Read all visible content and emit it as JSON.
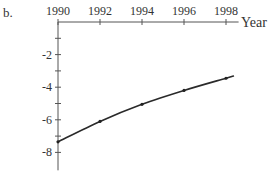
{
  "panel_label": "b.",
  "chart_data": {
    "type": "line",
    "title": "",
    "xlabel": "Year",
    "ylabel": "",
    "x": [
      1990,
      1992,
      1994,
      1996,
      1998
    ],
    "series": [
      {
        "name": "curve",
        "values": [
          -7.35,
          -6.1,
          -5.05,
          -4.2,
          -3.45
        ]
      }
    ],
    "x_ticks": [
      1990,
      1991,
      1992,
      1993,
      1994,
      1995,
      1996,
      1997,
      1998
    ],
    "x_tick_labels": [
      "1990",
      "1992",
      "1994",
      "1996",
      "1998"
    ],
    "y_ticks": [
      -1,
      -2,
      -3,
      -4,
      -5,
      -6,
      -7,
      -8
    ],
    "y_tick_labels": [
      "-2",
      "-4",
      "-6",
      "-8"
    ],
    "xlim": [
      1990,
      1998.6
    ],
    "ylim": [
      -9.1,
      0
    ],
    "grid": false,
    "legend": "none",
    "x_axis_position": "top",
    "markers": true
  }
}
